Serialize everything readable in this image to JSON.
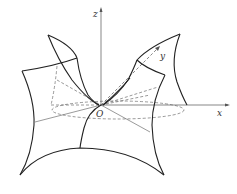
{
  "figure": {
    "type": "3d-surface-sketch",
    "axes": {
      "x_label": "x",
      "y_label": "y",
      "z_label": "z",
      "origin_label": "O"
    },
    "colors": {
      "stroke": "#2a2a2a",
      "axis": "#555555",
      "background": "#ffffff"
    }
  }
}
